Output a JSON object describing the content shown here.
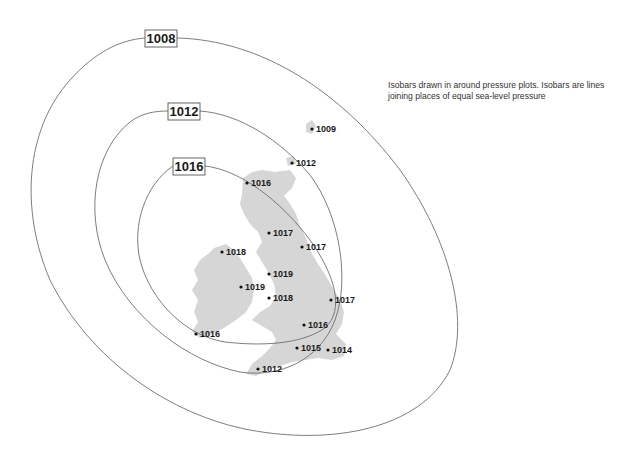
{
  "caption": "Isobars drawn in around pressure plots. Isobars are lines joining places of equal sea-level pressure",
  "units": "mb",
  "colors": {
    "land": "#d6d6d6",
    "isobar_line": "#6e6e6e",
    "text": "#1a1a1a",
    "background": "#ffffff"
  },
  "isobars": [
    {
      "value": "1008",
      "label_x": 145,
      "label_y": 30
    },
    {
      "value": "1012",
      "label_x": 168,
      "label_y": 103
    },
    {
      "value": "1016",
      "label_x": 173,
      "label_y": 158
    }
  ],
  "stations": [
    {
      "value": "1009",
      "x": 312,
      "y": 129
    },
    {
      "value": "1012",
      "x": 292,
      "y": 163
    },
    {
      "value": "1016",
      "x": 247,
      "y": 183
    },
    {
      "value": "1017",
      "x": 269,
      "y": 233
    },
    {
      "value": "1017",
      "x": 302,
      "y": 247
    },
    {
      "value": "1018",
      "x": 222,
      "y": 252
    },
    {
      "value": "1019",
      "x": 269,
      "y": 274
    },
    {
      "value": "1019",
      "x": 241,
      "y": 287
    },
    {
      "value": "1018",
      "x": 269,
      "y": 298
    },
    {
      "value": "1017",
      "x": 331,
      "y": 300
    },
    {
      "value": "1016",
      "x": 304,
      "y": 325
    },
    {
      "value": "1016",
      "x": 196,
      "y": 334
    },
    {
      "value": "1015",
      "x": 297,
      "y": 348
    },
    {
      "value": "1014",
      "x": 328,
      "y": 350
    },
    {
      "value": "1012",
      "x": 258,
      "y": 369
    }
  ]
}
